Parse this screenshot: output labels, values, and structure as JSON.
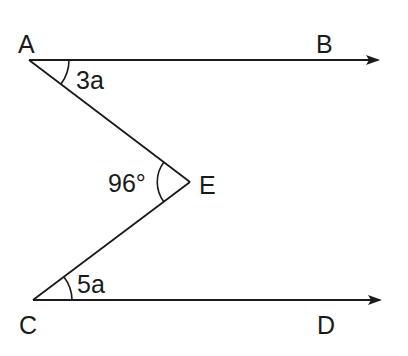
{
  "figure": {
    "type": "geometry-diagram",
    "stroke_color": "#1a1a1a",
    "background_color": "#ffffff"
  },
  "points": {
    "A": {
      "label": "A",
      "x": 29,
      "y": 60
    },
    "B": {
      "label": "B",
      "x": 378,
      "y": 60
    },
    "C": {
      "label": "C",
      "x": 33,
      "y": 300
    },
    "D": {
      "label": "D",
      "x": 380,
      "y": 300
    },
    "E": {
      "label": "E",
      "x": 190,
      "y": 182
    }
  },
  "segments": [
    {
      "from": "A",
      "to": "B",
      "arrow": true
    },
    {
      "from": "C",
      "to": "D",
      "arrow": true
    },
    {
      "from": "A",
      "to": "E",
      "arrow": false
    },
    {
      "from": "E",
      "to": "C",
      "arrow": false
    }
  ],
  "angles": {
    "angle_A": {
      "vertex": "A",
      "label": "3a"
    },
    "angle_E": {
      "vertex": "E",
      "label": "96°"
    },
    "angle_C": {
      "vertex": "C",
      "label": "5a"
    }
  }
}
